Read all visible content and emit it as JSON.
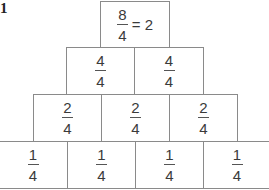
{
  "problem_label": "1",
  "pyramid": {
    "top": {
      "numerator": "8",
      "denominator": "4",
      "equation": "= 2"
    },
    "row2": [
      {
        "numerator": "4",
        "denominator": "4"
      },
      {
        "numerator": "4",
        "denominator": "4"
      }
    ],
    "row3": [
      {
        "numerator": "2",
        "denominator": "4"
      },
      {
        "numerator": "2",
        "denominator": "4"
      },
      {
        "numerator": "2",
        "denominator": "4"
      }
    ],
    "row4": [
      {
        "numerator": "1",
        "denominator": "4"
      },
      {
        "numerator": "1",
        "denominator": "4"
      },
      {
        "numerator": "1",
        "denominator": "4"
      },
      {
        "numerator": "1",
        "denominator": "4"
      }
    ]
  },
  "colors": {
    "border": "#8a8a8a",
    "text": "#3a3a3a"
  }
}
